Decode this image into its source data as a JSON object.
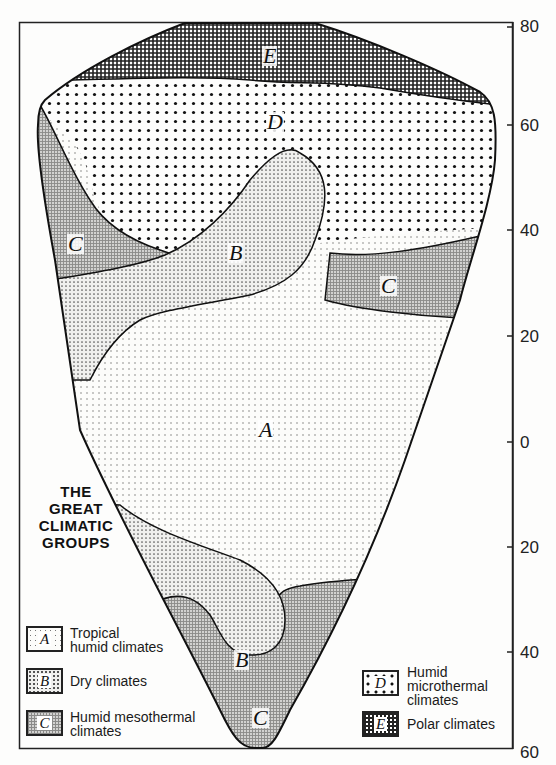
{
  "figure": {
    "title_lines": [
      "THE",
      "GREAT",
      "CLIMATIC",
      "GROUPS"
    ],
    "latitude_axis": {
      "ticks": [
        {
          "label": "80",
          "hemisphere": "north"
        },
        {
          "label": "60",
          "hemisphere": "north"
        },
        {
          "label": "40",
          "hemisphere": "north"
        },
        {
          "label": "20",
          "hemisphere": "north"
        },
        {
          "label": "0",
          "hemisphere": "equator"
        },
        {
          "label": "20",
          "hemisphere": "south"
        },
        {
          "label": "40",
          "hemisphere": "south"
        },
        {
          "label": "60",
          "hemisphere": "south"
        }
      ]
    },
    "regions": [
      {
        "code": "E",
        "name": "Polar climates",
        "label": "E"
      },
      {
        "code": "D",
        "name": "Humid microthermal climates",
        "label": "D"
      },
      {
        "code": "C",
        "name": "Humid mesothermal climates (NW)",
        "label": "C"
      },
      {
        "code": "B",
        "name": "Dry climates (north)",
        "label": "B"
      },
      {
        "code": "C",
        "name": "Humid mesothermal climates (NE)",
        "label": "C"
      },
      {
        "code": "A",
        "name": "Tropical humid climates",
        "label": "A"
      },
      {
        "code": "B",
        "name": "Dry climates (south)",
        "label": "B"
      },
      {
        "code": "C",
        "name": "Humid mesothermal climates (south)",
        "label": "C"
      }
    ],
    "legend": [
      {
        "code": "A",
        "swatch_label": "A",
        "lines": [
          "Tropical",
          "humid climates"
        ],
        "pattern": "fine-dots"
      },
      {
        "code": "B",
        "swatch_label": "B",
        "lines": [
          "Dry climates"
        ],
        "pattern": "dense-dots"
      },
      {
        "code": "C",
        "swatch_label": "C",
        "lines": [
          "Humid mesothermal",
          "climates"
        ],
        "pattern": "fine-grid"
      },
      {
        "code": "D",
        "swatch_label": "D",
        "lines": [
          "Humid",
          "microthermal",
          "climates"
        ],
        "pattern": "large-dots"
      },
      {
        "code": "E",
        "swatch_label": "E",
        "lines": [
          "Polar climates"
        ],
        "pattern": "dark-crosshatch"
      }
    ]
  }
}
